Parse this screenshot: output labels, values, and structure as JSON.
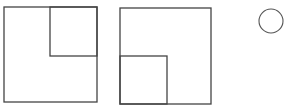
{
  "diagram": {
    "stroke_color": "#444444",
    "background": "#ffffff",
    "figures": [
      {
        "id": "square-1",
        "outer": {
          "x": 4,
          "y": 7,
          "w": 93,
          "h": 95
        },
        "inner": {
          "x": 50,
          "y": 7,
          "w": 47,
          "h": 49,
          "position": "top-right"
        }
      },
      {
        "id": "square-2",
        "outer": {
          "x": 120,
          "y": 8,
          "w": 91,
          "h": 96
        },
        "inner": {
          "x": 120,
          "y": 56,
          "w": 47,
          "h": 48,
          "position": "bottom-left"
        }
      },
      {
        "id": "circle",
        "cx": 271,
        "cy": 21,
        "r": 12
      }
    ]
  }
}
